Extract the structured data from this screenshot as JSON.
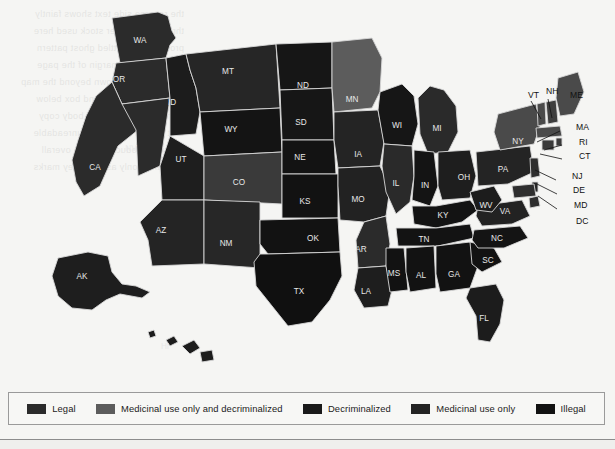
{
  "legend": {
    "items": [
      {
        "label": "Legal",
        "color": "#2b2b2b",
        "key": "legal"
      },
      {
        "label": "Medicinal use only and decriminalized",
        "color": "#5c5c5c",
        "key": "med_decrim"
      },
      {
        "label": "Decriminalized",
        "color": "#1a1a1a",
        "key": "decrim"
      },
      {
        "label": "Medicinal use only",
        "color": "#232323",
        "key": "med_only"
      },
      {
        "label": "Illegal",
        "color": "#121212",
        "key": "illegal"
      }
    ]
  },
  "map": {
    "title": "United States cannabis legality by state",
    "ocean_color": "#f5f5f3",
    "border_color": "#d8d8d8",
    "label_color": "#f0f0f0",
    "states": [
      {
        "code": "WA",
        "category": "legal",
        "fill": "#2b2b2b",
        "label_x": 140,
        "label_y": 41
      },
      {
        "code": "OR",
        "category": "legal",
        "fill": "#2b2b2b",
        "label_x": 119,
        "label_y": 80
      },
      {
        "code": "CA",
        "category": "legal",
        "fill": "#2b2b2b",
        "label_x": 95,
        "label_y": 168
      },
      {
        "code": "NV",
        "category": "legal",
        "fill": "#2b2b2b",
        "label_x": 131,
        "label_y": 149
      },
      {
        "code": "ID",
        "category": "med_only",
        "fill": "#1c1c1c",
        "label_x": 172,
        "label_y": 103
      },
      {
        "code": "MT",
        "category": "legal",
        "fill": "#262626",
        "label_x": 228,
        "label_y": 72
      },
      {
        "code": "WY",
        "category": "illegal",
        "fill": "#141414",
        "label_x": 231,
        "label_y": 130
      },
      {
        "code": "UT",
        "category": "med_only",
        "fill": "#1e1e1e",
        "label_x": 181,
        "label_y": 160
      },
      {
        "code": "CO",
        "category": "legal",
        "fill": "#3a3a3a",
        "label_x": 239,
        "label_y": 183
      },
      {
        "code": "AZ",
        "category": "med_only",
        "fill": "#242424",
        "label_x": 161,
        "label_y": 231
      },
      {
        "code": "NM",
        "category": "legal",
        "fill": "#272727",
        "label_x": 226,
        "label_y": 244
      },
      {
        "code": "ND",
        "category": "illegal",
        "fill": "#161616",
        "label_x": 303,
        "label_y": 86
      },
      {
        "code": "SD",
        "category": "illegal",
        "fill": "#161616",
        "label_x": 301,
        "label_y": 123
      },
      {
        "code": "NE",
        "category": "illegal",
        "fill": "#131313",
        "label_x": 300,
        "label_y": 158
      },
      {
        "code": "KS",
        "category": "illegal",
        "fill": "#121212",
        "label_x": 305,
        "label_y": 202
      },
      {
        "code": "OK",
        "category": "illegal",
        "fill": "#121212",
        "label_x": 313,
        "label_y": 239
      },
      {
        "code": "TX",
        "category": "illegal",
        "fill": "#101010",
        "label_x": 299,
        "label_y": 292
      },
      {
        "code": "MN",
        "category": "med_decrim",
        "fill": "#5c5c5c",
        "label_x": 352,
        "label_y": 100
      },
      {
        "code": "IA",
        "category": "med_only",
        "fill": "#242424",
        "label_x": 358,
        "label_y": 155
      },
      {
        "code": "MO",
        "category": "med_only",
        "fill": "#222222",
        "label_x": 358,
        "label_y": 200
      },
      {
        "code": "AR",
        "category": "med_only",
        "fill": "#2b2b2b",
        "label_x": 361,
        "label_y": 250
      },
      {
        "code": "LA",
        "category": "med_only",
        "fill": "#1e1e1e",
        "label_x": 366,
        "label_y": 292
      },
      {
        "code": "WI",
        "category": "illegal",
        "fill": "#161616",
        "label_x": 397,
        "label_y": 126
      },
      {
        "code": "IL",
        "category": "legal",
        "fill": "#2a2a2a",
        "label_x": 396,
        "label_y": 184
      },
      {
        "code": "MI",
        "category": "legal",
        "fill": "#2a2a2a",
        "label_x": 437,
        "label_y": 129
      },
      {
        "code": "IN",
        "category": "illegal",
        "fill": "#141414",
        "label_x": 425,
        "label_y": 186
      },
      {
        "code": "OH",
        "category": "med_only",
        "fill": "#1e1e1e",
        "label_x": 464,
        "label_y": 178
      },
      {
        "code": "KY",
        "category": "illegal",
        "fill": "#131313",
        "label_x": 443,
        "label_y": 216
      },
      {
        "code": "TN",
        "category": "illegal",
        "fill": "#131313",
        "label_x": 424,
        "label_y": 240
      },
      {
        "code": "MS",
        "category": "illegal",
        "fill": "#121212",
        "label_x": 394,
        "label_y": 274
      },
      {
        "code": "AL",
        "category": "illegal",
        "fill": "#121212",
        "label_x": 421,
        "label_y": 276
      },
      {
        "code": "GA",
        "category": "illegal",
        "fill": "#121212",
        "label_x": 454,
        "label_y": 275
      },
      {
        "code": "FL",
        "category": "med_only",
        "fill": "#1c1c1c",
        "label_x": 484,
        "label_y": 319
      },
      {
        "code": "SC",
        "category": "illegal",
        "fill": "#121212",
        "label_x": 488,
        "label_y": 261
      },
      {
        "code": "NC",
        "category": "illegal",
        "fill": "#141414",
        "label_x": 497,
        "label_y": 239
      },
      {
        "code": "VA",
        "category": "legal",
        "fill": "#222222",
        "label_x": 505,
        "label_y": 212
      },
      {
        "code": "WV",
        "category": "med_only",
        "fill": "#1c1c1c",
        "label_x": 486,
        "label_y": 206
      },
      {
        "code": "PA",
        "category": "med_only",
        "fill": "#242424",
        "label_x": 503,
        "label_y": 170
      },
      {
        "code": "NY",
        "category": "legal",
        "fill": "#4a4a4a",
        "label_x": 518,
        "label_y": 142
      },
      {
        "code": "VT",
        "category": "legal",
        "fill": "#4a4a4a",
        "label_x": 528,
        "label_y": 96
      },
      {
        "code": "NH",
        "category": "decrim",
        "fill": "#3e3e3e",
        "label_x": 546,
        "label_y": 92
      },
      {
        "code": "ME",
        "category": "legal",
        "fill": "#4a4a4a",
        "label_x": 570,
        "label_y": 96
      },
      {
        "code": "MA",
        "category": "legal",
        "fill": "#4a4a4a",
        "label_x": 576,
        "label_y": 128
      },
      {
        "code": "RI",
        "category": "legal",
        "fill": "#3a3a3a",
        "label_x": 579,
        "label_y": 143
      },
      {
        "code": "CT",
        "category": "legal",
        "fill": "#3a3a3a",
        "label_x": 579,
        "label_y": 157
      },
      {
        "code": "NJ",
        "category": "legal",
        "fill": "#2e2e2e",
        "label_x": 572,
        "label_y": 177
      },
      {
        "code": "DE",
        "category": "decrim",
        "fill": "#262626",
        "label_x": 573,
        "label_y": 191
      },
      {
        "code": "MD",
        "category": "legal",
        "fill": "#2e2e2e",
        "label_x": 574,
        "label_y": 206
      },
      {
        "code": "DC",
        "category": "legal",
        "fill": "#2e2e2e",
        "label_x": 576,
        "label_y": 222
      },
      {
        "code": "AK",
        "category": "legal",
        "fill": "#1e1e1e",
        "label_x": 82,
        "label_y": 277
      },
      {
        "code": "HI",
        "category": "med_only",
        "fill": "#1c1c1c",
        "label_x": 165,
        "label_y": 347
      }
    ],
    "callout_labels": [
      "VT",
      "NH",
      "ME",
      "MA",
      "RI",
      "CT",
      "NJ",
      "DE",
      "MD",
      "DC"
    ]
  }
}
